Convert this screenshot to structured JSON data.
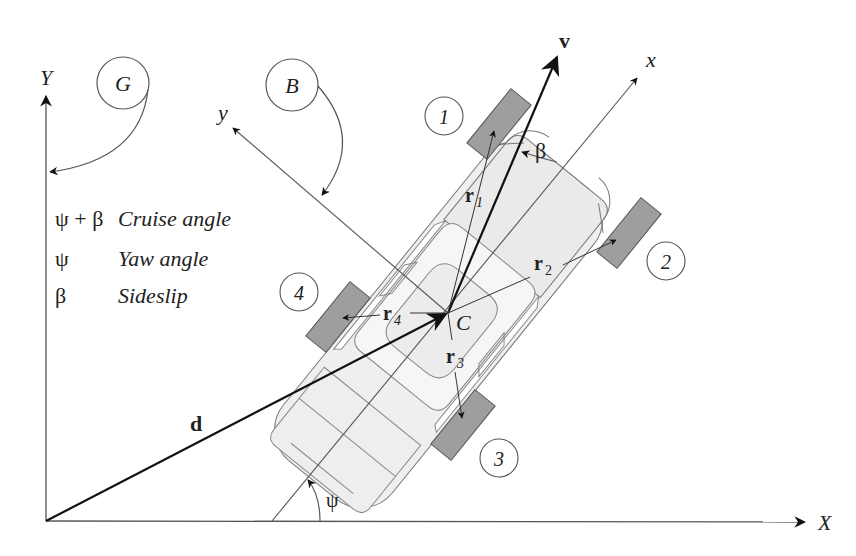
{
  "diagram": {
    "frames": {
      "global": {
        "label": "G",
        "x_axis_label": "X",
        "y_axis_label": "Y"
      },
      "body": {
        "label": "B",
        "x_axis_label": "x",
        "y_axis_label": "y"
      }
    },
    "vectors": {
      "velocity": "v",
      "position": "d",
      "r1": {
        "base": "r",
        "sub": "1"
      },
      "r2": {
        "base": "r",
        "sub": "2"
      },
      "r3": {
        "base": "r",
        "sub": "3"
      },
      "r4": {
        "base": "r",
        "sub": "4"
      }
    },
    "center_label": "C",
    "wheels": [
      "1",
      "2",
      "3",
      "4"
    ],
    "angles": {
      "beta": "β",
      "psi": "ψ"
    },
    "legend": [
      {
        "symbol": "ψ + β",
        "description": "Cruise angle"
      },
      {
        "symbol": "ψ",
        "description": "Yaw angle"
      },
      {
        "symbol": "β",
        "description": "Sideslip"
      }
    ],
    "colors": {
      "line": "#555555",
      "heavy_line": "#111111",
      "car_body": "#efefef",
      "wheel": "#9e9e9e",
      "wheel_stroke": "#555555"
    }
  }
}
